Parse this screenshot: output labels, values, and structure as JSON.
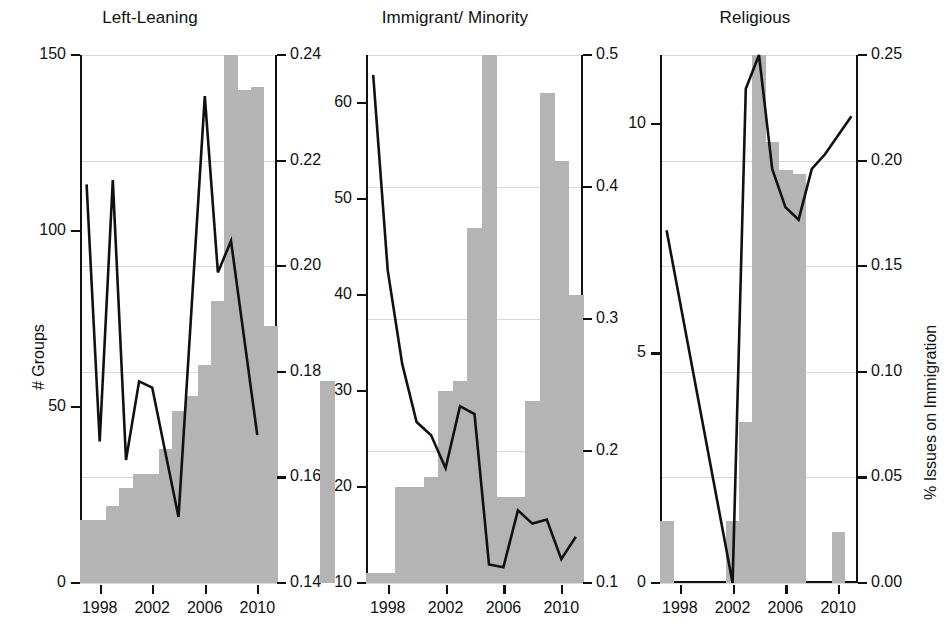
{
  "figure": {
    "left_axis_title": "# Groups",
    "right_axis_title": "% Issues on Immigration"
  },
  "chart_data": [
    {
      "type": "bar",
      "title": "Left-Leaning",
      "xlabel": "",
      "ylabel": "# Groups",
      "y2label": "% Issues on Immigration",
      "grid": true,
      "legend": "none",
      "x": [
        1997,
        1998,
        1999,
        2000,
        2001,
        2002,
        2003,
        2004,
        2005,
        2006,
        2007,
        2008,
        2009,
        2010,
        2011
      ],
      "xticks": [
        1998,
        2002,
        2006,
        2010
      ],
      "ylim": [
        0,
        150
      ],
      "yticks": [
        0,
        50,
        100,
        150
      ],
      "y2lim": [
        0.14,
        0.24
      ],
      "y2ticks": [
        0.14,
        0.16,
        0.18,
        0.2,
        0.22,
        0.24
      ],
      "y2ticklabels": [
        "0.14",
        "0.16",
        "0.18",
        "0.20",
        "0.22",
        "0.24"
      ],
      "series": [
        {
          "name": "# Groups",
          "kind": "bar",
          "axis": "left",
          "values": [
            18,
            18,
            22,
            27,
            31,
            31,
            38,
            49,
            53,
            62,
            80,
            150,
            140,
            141,
            73
          ]
        },
        {
          "name": "% Issues on Immigration",
          "kind": "line",
          "axis": "right",
          "values": [
            0.2155,
            0.1668,
            0.2163,
            0.1633,
            0.1782,
            0.177,
            0.1525,
            0.2322,
            0.1988,
            0.2048,
            0.168
          ],
          "x": [
            1997,
            1998,
            1999,
            2000,
            2001,
            2002,
            2004,
            2006,
            2007,
            2008,
            2010
          ]
        }
      ]
    },
    {
      "type": "bar",
      "title": "Immigrant/ Minority",
      "xlabel": "",
      "ylabel": "# Groups",
      "y2label": "% Issues on Immigration",
      "grid": true,
      "legend": "none",
      "x": [
        1997,
        1998,
        1999,
        2000,
        2001,
        2002,
        2003,
        2004,
        2005,
        2006,
        2007,
        2008,
        2009,
        2010,
        2011
      ],
      "xticks": [
        1998,
        2002,
        2006,
        2010
      ],
      "ylim": [
        10,
        65
      ],
      "yticks": [
        10,
        20,
        30,
        40,
        50,
        60
      ],
      "y2lim": [
        0.1,
        0.5
      ],
      "y2ticks": [
        0.1,
        0.2,
        0.3,
        0.4,
        0.5
      ],
      "y2ticklabels": [
        "0.1",
        "0.2",
        "0.3",
        "0.4",
        "0.5"
      ],
      "series": [
        {
          "name": "# Groups",
          "kind": "bar",
          "axis": "left",
          "values": [
            11,
            11,
            20,
            20,
            21,
            30,
            31,
            47,
            65,
            19,
            19,
            29,
            61,
            54,
            40,
            31
          ]
        },
        {
          "name": "% Issues on Immigration",
          "kind": "line",
          "axis": "right",
          "values": [
            0.485,
            0.337,
            0.266,
            0.222,
            0.212,
            0.187,
            0.234,
            0.228,
            0.114,
            0.112,
            0.155,
            0.145,
            0.148,
            0.118,
            0.135
          ],
          "x": [
            1997,
            1998,
            1999,
            2000,
            2001,
            2002,
            2003,
            2004,
            2005,
            2006,
            2007,
            2008,
            2009,
            2010,
            2011
          ]
        }
      ]
    },
    {
      "type": "bar",
      "title": "Religious",
      "xlabel": "",
      "ylabel": "# Groups",
      "y2label": "% Issues on Immigration",
      "grid": true,
      "legend": "none",
      "x": [
        1997,
        1998,
        1999,
        2000,
        2001,
        2002,
        2003,
        2004,
        2005,
        2006,
        2007,
        2008,
        2009,
        2010,
        2011
      ],
      "xticks": [
        1998,
        2002,
        2006,
        2010
      ],
      "ylim": [
        0,
        11.5
      ],
      "yticks": [
        0,
        5,
        10
      ],
      "y2lim": [
        0.0,
        0.25
      ],
      "y2ticks": [
        0.0,
        0.05,
        0.1,
        0.15,
        0.2,
        0.25
      ],
      "y2ticklabels": [
        "0.00",
        "0.05",
        "0.10",
        "0.15",
        "0.20",
        "0.25"
      ],
      "series": [
        {
          "name": "# Groups",
          "kind": "bar",
          "axis": "left",
          "values": [
            1.35,
            0,
            0,
            0,
            0,
            1.35,
            3.5,
            11.5,
            9.6,
            9.0,
            8.9,
            0,
            1.1
          ],
          "x": [
            1997,
            1998,
            1999,
            2000,
            2001,
            2002,
            2003,
            2004,
            2005,
            2006,
            2007,
            2009,
            2010
          ]
        },
        {
          "name": "% Issues on Immigration",
          "kind": "line",
          "axis": "right",
          "values": [
            0.167,
            0.0,
            0.234,
            0.25,
            0.196,
            0.178,
            0.172,
            0.196,
            0.203,
            0.221
          ],
          "x": [
            1997,
            2002,
            2003,
            2004,
            2005,
            2006,
            2007,
            2008,
            2009,
            2011
          ]
        }
      ]
    }
  ]
}
